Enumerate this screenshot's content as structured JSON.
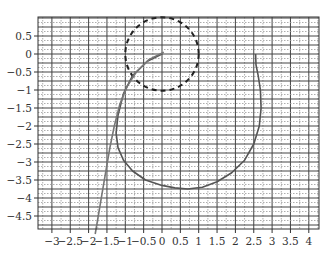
{
  "chart_data": {
    "type": "line",
    "title": "",
    "xlabel": "",
    "ylabel": "",
    "xlim": [
      -3.4,
      4.25
    ],
    "ylim": [
      -5.0,
      1.0
    ],
    "grid": true,
    "legend": null,
    "x_ticks": [
      -3,
      -2.5,
      -2,
      -1.5,
      -1,
      -0.5,
      0,
      0.5,
      1,
      1.5,
      2,
      2.5,
      3,
      3.5,
      4
    ],
    "x_tick_labels": [
      "−3",
      "−2.5",
      "−2",
      "−1.5",
      "−1",
      "−0.5",
      "0",
      "0.5",
      "1",
      "1.5",
      "2",
      "2.5",
      "3",
      "3.5",
      "4"
    ],
    "y_ticks": [
      0.5,
      0,
      -0.5,
      -1,
      -1.5,
      -2,
      -2.5,
      -3,
      -3.5,
      -4,
      -4.5
    ],
    "y_tick_labels": [
      "0.5",
      "0",
      "−0.5",
      "−1",
      "−1.5",
      "−2",
      "−2.5",
      "−3",
      "−3.5",
      "−4",
      "−4.5"
    ],
    "series": [
      {
        "name": "unit-circle",
        "style": "dashed",
        "color": "#222222",
        "shape": "circle",
        "center": [
          0,
          0
        ],
        "radius": 1
      },
      {
        "name": "looping-curve",
        "style": "solid",
        "color": "#555555",
        "x": [
          0.0,
          -0.4,
          -0.8,
          -1.05,
          -1.2,
          -1.25,
          -1.2,
          -1.05,
          -0.8,
          -0.45,
          0.0,
          0.35,
          0.7,
          1.1,
          1.5,
          1.9,
          2.25,
          2.5,
          2.65,
          2.7,
          2.68,
          2.62,
          2.56,
          2.55
        ],
        "y": [
          0.0,
          -0.2,
          -0.6,
          -1.1,
          -1.7,
          -2.2,
          -2.6,
          -2.95,
          -3.25,
          -3.5,
          -3.65,
          -3.72,
          -3.75,
          -3.7,
          -3.55,
          -3.3,
          -2.95,
          -2.5,
          -2.0,
          -1.5,
          -1.0,
          -0.6,
          -0.3,
          0.0
        ]
      },
      {
        "name": "falling-curve",
        "style": "solid",
        "color": "#777777",
        "x": [
          0.05,
          -0.35,
          -0.7,
          -0.95,
          -1.15,
          -1.3,
          -1.42,
          -1.52,
          -1.62,
          -1.72,
          -1.82
        ],
        "y": [
          0.05,
          -0.15,
          -0.5,
          -0.9,
          -1.4,
          -2.0,
          -2.6,
          -3.2,
          -3.8,
          -4.4,
          -5.0
        ]
      }
    ]
  }
}
